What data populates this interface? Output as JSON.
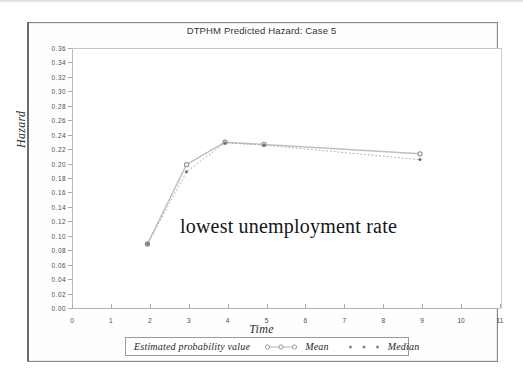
{
  "figure": {
    "title": "DTPHM Predicted Hazard: Case 5",
    "annotation": "lowest unemployment rate"
  },
  "legend": {
    "title": "Estimated probability value",
    "entries": [
      {
        "label": "Mean",
        "marker": "open-circle",
        "line": "solid"
      },
      {
        "label": "Median",
        "marker": "filled-dot",
        "line": "dotted"
      }
    ]
  },
  "chart_data": {
    "type": "line",
    "title": "DTPHM Predicted Hazard: Case 5",
    "xlabel": "Time",
    "ylabel": "Hazard",
    "xlim": [
      0,
      11
    ],
    "ylim": [
      0.0,
      0.36
    ],
    "xticks": [
      "0",
      "1",
      "2",
      "3",
      "4",
      "5",
      "6",
      "7",
      "8",
      "9",
      "10",
      "11"
    ],
    "yticks": [
      "0.00",
      "0.02",
      "0.04",
      "0.06",
      "0.08",
      "0.10",
      "0.12",
      "0.14",
      "0.16",
      "0.18",
      "0.20",
      "0.22",
      "0.24",
      "0.26",
      "0.28",
      "0.30",
      "0.32",
      "0.34",
      "0.36"
    ],
    "grid": false,
    "legend_position": "below-axis",
    "annotations": [
      {
        "text": "lowest unemployment rate",
        "x": 4.6,
        "y": 0.105
      }
    ],
    "series": [
      {
        "name": "Mean",
        "x": [
          2,
          3,
          4,
          5,
          9
        ],
        "values": [
          0.09,
          0.2,
          0.231,
          0.228,
          0.215
        ],
        "color": "#b8b8b8",
        "marker": "open-circle",
        "line": "solid"
      },
      {
        "name": "Median",
        "x": [
          2,
          3,
          4,
          5,
          9
        ],
        "values": [
          0.09,
          0.19,
          0.23,
          0.227,
          0.207
        ],
        "color": "#9e9e9e",
        "marker": "filled-dot",
        "line": "dotted"
      }
    ]
  },
  "colors": {
    "frame": "#8a8a8a",
    "axis": "#b3b3b3",
    "series_mean": "#b8b8b8",
    "series_median": "#9e9e9e",
    "text": "#2b2b2b"
  }
}
